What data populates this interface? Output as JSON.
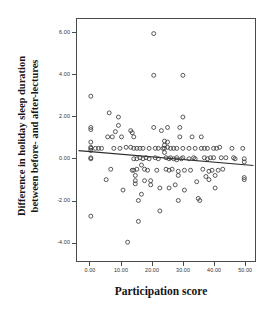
{
  "chart_data": {
    "type": "scatter",
    "title": "",
    "xlabel": "Participation score",
    "ylabel_line1": "Difference in holiday sleep duration",
    "ylabel_line2": "between before- and after-lectures",
    "xlim": [
      -4.5,
      53.5
    ],
    "ylim": [
      -4.9,
      6.7
    ],
    "xticks": [
      0,
      10,
      20,
      30,
      40,
      50
    ],
    "xticklabels": [
      "0.00",
      "10.00",
      "20.00",
      "30.00",
      "40.00",
      "50.00"
    ],
    "yticks": [
      6,
      4,
      2,
      0,
      -2,
      -4
    ],
    "yticklabels": [
      "6.00",
      "4.00",
      "2.00",
      "0.00",
      "-2.00",
      "-4.00"
    ],
    "grid": false,
    "legend": null,
    "marker": "open-circle",
    "marker_color": "#3a3a3a",
    "marker_size": 4.0,
    "fit_line": {
      "type": "linear-regression",
      "color": "#2b2b2b",
      "x_start": -4.0,
      "y_start": 0.39,
      "x_end": 53.0,
      "y_end": -0.32
    },
    "points": [
      [
        0.0,
        3.0
      ],
      [
        0.0,
        1.5
      ],
      [
        0.0,
        1.4
      ],
      [
        0.0,
        0.8
      ],
      [
        0.0,
        0.55
      ],
      [
        0.0,
        0.5
      ],
      [
        0.0,
        0.4
      ],
      [
        0.0,
        0.05
      ],
      [
        0.0,
        0.0
      ],
      [
        0.0,
        -2.75
      ],
      [
        1.5,
        0.5
      ],
      [
        2.5,
        0.5
      ],
      [
        3.5,
        0.5
      ],
      [
        5.0,
        -1.0
      ],
      [
        5.5,
        1.05
      ],
      [
        6.0,
        2.2
      ],
      [
        6.5,
        -0.5
      ],
      [
        7.0,
        1.05
      ],
      [
        7.5,
        0.5
      ],
      [
        8.0,
        1.3
      ],
      [
        9.0,
        2.0
      ],
      [
        9.0,
        1.6
      ],
      [
        9.5,
        0.5
      ],
      [
        10.0,
        1.05
      ],
      [
        10.5,
        -1.5
      ],
      [
        11.5,
        0.55
      ],
      [
        12.0,
        -4.0
      ],
      [
        13.0,
        1.35
      ],
      [
        13.5,
        1.25
      ],
      [
        13.0,
        0.55
      ],
      [
        13.5,
        -0.55
      ],
      [
        14.0,
        1.05
      ],
      [
        14.0,
        0.5
      ],
      [
        14.0,
        0.0
      ],
      [
        14.0,
        -0.55
      ],
      [
        14.5,
        -0.8
      ],
      [
        14.5,
        -1.05
      ],
      [
        14.5,
        -1.2
      ],
      [
        15.0,
        0.5
      ],
      [
        15.0,
        0.0
      ],
      [
        15.0,
        -0.5
      ],
      [
        15.5,
        -2.0
      ],
      [
        15.5,
        -3.0
      ],
      [
        16.0,
        0.5
      ],
      [
        16.0,
        0.05
      ],
      [
        16.5,
        -0.3
      ],
      [
        16.5,
        -1.7
      ],
      [
        17.0,
        0.5
      ],
      [
        17.0,
        0.0
      ],
      [
        17.5,
        -0.5
      ],
      [
        17.5,
        -1.05
      ],
      [
        18.0,
        0.05
      ],
      [
        18.5,
        -0.55
      ],
      [
        19.0,
        0.5
      ],
      [
        19.0,
        0.0
      ],
      [
        19.5,
        -1.05
      ],
      [
        19.5,
        -1.25
      ],
      [
        20.5,
        1.5
      ],
      [
        20.5,
        6.0
      ],
      [
        20.5,
        4.0
      ],
      [
        21.0,
        0.5
      ],
      [
        21.0,
        0.05
      ],
      [
        21.5,
        -0.55
      ],
      [
        22.0,
        0.5
      ],
      [
        22.0,
        0.0
      ],
      [
        22.5,
        -1.4
      ],
      [
        22.5,
        -2.5
      ],
      [
        23.0,
        1.35
      ],
      [
        23.5,
        0.5
      ],
      [
        24.0,
        0.85
      ],
      [
        24.0,
        0.65
      ],
      [
        24.0,
        0.5
      ],
      [
        24.0,
        0.3
      ],
      [
        24.5,
        0.05
      ],
      [
        24.5,
        -0.5
      ],
      [
        25.0,
        1.5
      ],
      [
        25.0,
        0.8
      ],
      [
        25.0,
        0.55
      ],
      [
        25.5,
        0.0
      ],
      [
        25.5,
        -0.55
      ],
      [
        25.5,
        -1.4
      ],
      [
        26.0,
        0.5
      ],
      [
        26.0,
        0.05
      ],
      [
        26.5,
        -0.5
      ],
      [
        27.0,
        0.5
      ],
      [
        27.0,
        0.0
      ],
      [
        27.5,
        -1.25
      ],
      [
        28.0,
        0.5
      ],
      [
        28.0,
        0.05
      ],
      [
        28.0,
        -0.05
      ],
      [
        28.5,
        -0.6
      ],
      [
        28.5,
        -0.8
      ],
      [
        28.5,
        -2.0
      ],
      [
        29.0,
        1.5
      ],
      [
        29.0,
        1.05
      ],
      [
        29.5,
        0.0
      ],
      [
        30.0,
        2.0
      ],
      [
        30.0,
        4.0
      ],
      [
        30.0,
        0.5
      ],
      [
        30.0,
        0.05
      ],
      [
        30.5,
        -0.55
      ],
      [
        30.5,
        -1.5
      ],
      [
        32.0,
        0.5
      ],
      [
        32.0,
        0.0
      ],
      [
        32.5,
        -0.55
      ],
      [
        33.0,
        1.05
      ],
      [
        33.5,
        0.05
      ],
      [
        34.0,
        0.5
      ],
      [
        34.0,
        0.0
      ],
      [
        34.5,
        -1.1
      ],
      [
        35.0,
        -1.9
      ],
      [
        35.5,
        -2.0
      ],
      [
        36.0,
        1.05
      ],
      [
        36.0,
        0.5
      ],
      [
        36.5,
        -0.5
      ],
      [
        37.0,
        0.5
      ],
      [
        37.0,
        0.05
      ],
      [
        37.5,
        -0.85
      ],
      [
        38.0,
        0.5
      ],
      [
        38.0,
        0.0
      ],
      [
        38.5,
        -0.6
      ],
      [
        38.5,
        -1.0
      ],
      [
        39.0,
        0.05
      ],
      [
        39.5,
        -0.55
      ],
      [
        40.0,
        0.5
      ],
      [
        40.0,
        0.05
      ],
      [
        40.5,
        -0.8
      ],
      [
        40.5,
        -1.4
      ],
      [
        41.0,
        0.5
      ],
      [
        41.5,
        -0.55
      ],
      [
        42.0,
        0.55
      ],
      [
        42.5,
        0.05
      ],
      [
        43.0,
        -0.5
      ],
      [
        44.0,
        0.05
      ],
      [
        46.0,
        0.5
      ],
      [
        46.5,
        0.05
      ],
      [
        47.0,
        0.0
      ],
      [
        49.5,
        0.5
      ],
      [
        50.0,
        0.0
      ],
      [
        50.0,
        -0.15
      ],
      [
        50.0,
        -0.9
      ],
      [
        50.0,
        -1.0
      ]
    ]
  }
}
